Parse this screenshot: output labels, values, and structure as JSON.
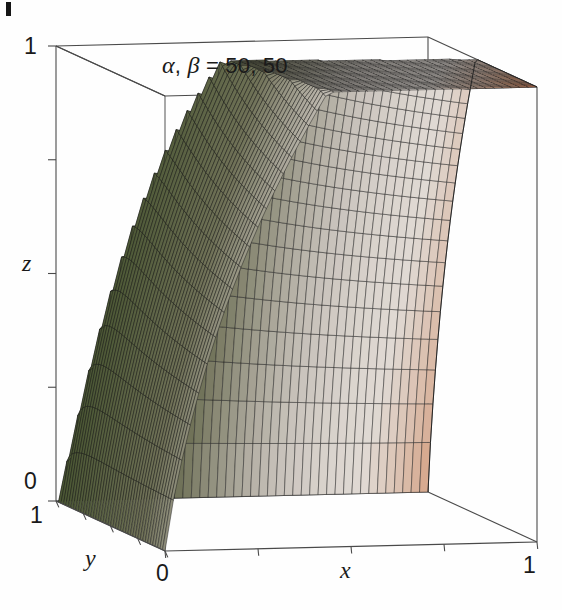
{
  "figure": {
    "title": "α, β = 50, 50",
    "title_alpha": "α",
    "title_beta": "β",
    "title_sep": ", ",
    "title_eq": " = 50, 50",
    "corner_mark": "page-edge-mark"
  },
  "axes": {
    "x": {
      "label": "x",
      "ticks": [
        "0",
        "1"
      ],
      "tick_min": "0",
      "tick_max": "1",
      "range": [
        0,
        1
      ]
    },
    "y": {
      "label": "y",
      "ticks": [
        "1",
        "0"
      ],
      "tick_min": "0",
      "tick_max": "1",
      "range": [
        0,
        1
      ]
    },
    "z": {
      "label": "z",
      "ticks": [
        "0",
        "1"
      ],
      "tick_min": "0",
      "tick_max": "1",
      "range": [
        0,
        1
      ]
    }
  },
  "chart_data": {
    "type": "surface3d",
    "title": "α, β = 50, 50",
    "xlabel": "x",
    "ylabel": "y",
    "zlabel": "z",
    "xlim": [
      0,
      1
    ],
    "ylim": [
      0,
      1
    ],
    "zlim": [
      0,
      1
    ],
    "xticks": [
      0,
      1
    ],
    "yticks": [
      1,
      0
    ],
    "zticks": [
      0,
      1
    ],
    "grid": false,
    "box": true,
    "mesh": true,
    "mesh_n": 44,
    "parameters": {
      "alpha": 50,
      "beta": 50
    },
    "colormap": {
      "low": "#35471f",
      "mid": "#d8d2cc",
      "high": "#c2562f",
      "stops": [
        {
          "t": 0.0,
          "color": "#35471f"
        },
        {
          "t": 0.35,
          "color": "#6f7157"
        },
        {
          "t": 0.55,
          "color": "#b8b2aa"
        },
        {
          "t": 0.72,
          "color": "#ddd6d0"
        },
        {
          "t": 0.88,
          "color": "#d08a63"
        },
        {
          "t": 1.0,
          "color": "#c2562f"
        }
      ]
    },
    "box_color": "#4a4a4a",
    "mesh_color": "#1b1b1b",
    "view": {
      "corners_px": {
        "top_left": [
          56,
          46
        ],
        "top_back": [
          430,
          29
        ],
        "top_right": [
          537,
          90
        ],
        "bottom_left": [
          56,
          501
        ],
        "origin": [
          165,
          551
        ],
        "bottom_right": [
          537,
          542
        ]
      },
      "apex_px": [
        425,
        43
      ]
    },
    "sample_points": [
      {
        "x": 0.0,
        "y": 0.0,
        "z": 0.0
      },
      {
        "x": 1.0,
        "y": 0.0,
        "z": 1.0
      },
      {
        "x": 0.0,
        "y": 1.0,
        "z": 0.0
      },
      {
        "x": 1.0,
        "y": 1.0,
        "z": 1.0
      },
      {
        "x": 0.5,
        "y": 0.5,
        "z": 0.5
      }
    ]
  }
}
